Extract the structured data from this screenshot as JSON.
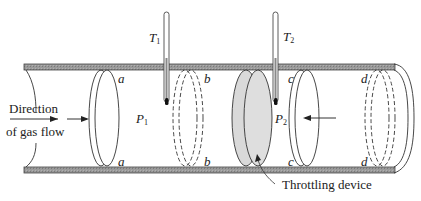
{
  "figure": {
    "flow_label_line1": "Direction",
    "flow_label_line2": "of gas flow",
    "throttle_label": "Throttling device",
    "thermometers": [
      {
        "symbol": "T",
        "subscript": "1"
      },
      {
        "symbol": "T",
        "subscript": "2"
      }
    ],
    "pressures": [
      {
        "symbol": "P",
        "subscript": "1"
      },
      {
        "symbol": "P",
        "subscript": "2"
      }
    ],
    "piston_positions": {
      "a_top": "a",
      "a_bottom": "a",
      "b_top": "b",
      "b_bottom": "b",
      "c_top": "c",
      "c_bottom": "c",
      "d_top": "d",
      "d_bottom": "d"
    }
  },
  "colors": {
    "tube_wall": "#8a8a8a",
    "line": "#333333",
    "throttle_fill": "#d9d9d9"
  }
}
